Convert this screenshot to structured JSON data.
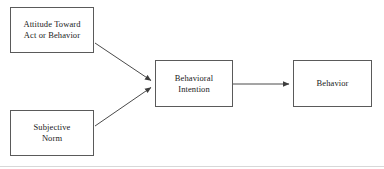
{
  "diagram": {
    "type": "flow-diagram",
    "canvas": {
      "width": 384,
      "height": 169,
      "background": "#ffffff"
    },
    "style": {
      "box_border_color": "#5a5a5a",
      "box_fill": "#ffffff",
      "edge_color": "#4a4a4a",
      "text_color": "#1a1a1a",
      "rule_color": "#d8d8d8"
    },
    "nodes": [
      {
        "id": "attitude",
        "label": "Attitude Toward\nAct or Behavior",
        "x": 10,
        "y": 7,
        "width": 84,
        "height": 46
      },
      {
        "id": "subjective-norm",
        "label": "Subjective\nNorm",
        "x": 10,
        "y": 110,
        "width": 84,
        "height": 46
      },
      {
        "id": "behavioral-intention",
        "label": "Behavioral\nIntention",
        "x": 155,
        "y": 60,
        "width": 78,
        "height": 47
      },
      {
        "id": "behavior",
        "label": "Behavior",
        "x": 293,
        "y": 60,
        "width": 79,
        "height": 47
      }
    ],
    "edges": [
      {
        "id": "attitude-to-intention",
        "from": "attitude",
        "to": "behavioral-intention",
        "kind": "arrow",
        "x1": 95,
        "y1": 43,
        "x2": 152,
        "y2": 81
      },
      {
        "id": "norm-to-intention",
        "from": "subjective-norm",
        "to": "behavioral-intention",
        "kind": "arrow",
        "x1": 95,
        "y1": 126,
        "x2": 152,
        "y2": 87
      },
      {
        "id": "intention-to-behavior",
        "from": "behavioral-intention",
        "to": "behavior",
        "kind": "arrow",
        "x1": 233,
        "y1": 84,
        "x2": 290,
        "y2": 84
      }
    ],
    "rules": [
      {
        "id": "bottom-rule",
        "y": 166
      }
    ]
  }
}
